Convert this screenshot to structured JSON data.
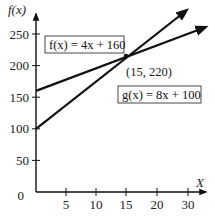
{
  "chart_data": {
    "type": "line",
    "title": "",
    "xlabel": "X",
    "ylabel": "f(x)",
    "xlim": [
      0,
      32
    ],
    "ylim": [
      0,
      275
    ],
    "x_ticks": [
      5,
      10,
      15,
      20,
      30
    ],
    "x_tick_labels": [
      "5",
      "10",
      "15",
      "20",
      "30"
    ],
    "y_ticks": [
      0,
      50,
      100,
      150,
      200,
      250
    ],
    "y_tick_labels": [
      "0",
      "50",
      "100",
      "150",
      "200",
      "250"
    ],
    "grid": false,
    "series": [
      {
        "name": "f(x) = 4x + 160",
        "label": "f(x) = 4x + 160",
        "slope": 4,
        "intercept": 160,
        "x": [
          0,
          15,
          28
        ],
        "values": [
          160,
          220,
          272
        ]
      },
      {
        "name": "g(x) = 8x + 100",
        "label": "g(x) = 8x + 100",
        "slope": 8,
        "intercept": 100,
        "x": [
          0,
          15,
          25
        ],
        "values": [
          100,
          220,
          300
        ]
      }
    ],
    "annotations": [
      {
        "text": "(15, 220)",
        "x": 15,
        "y": 220
      }
    ],
    "line_color": "#111111"
  },
  "labels": {
    "y_axis_title": "f(x)",
    "x_axis_title": "X",
    "f_equation": "f(x) = 4x + 160",
    "g_equation": "g(x) = 8x + 100",
    "intersection": "(15, 220)",
    "zero": "0"
  }
}
